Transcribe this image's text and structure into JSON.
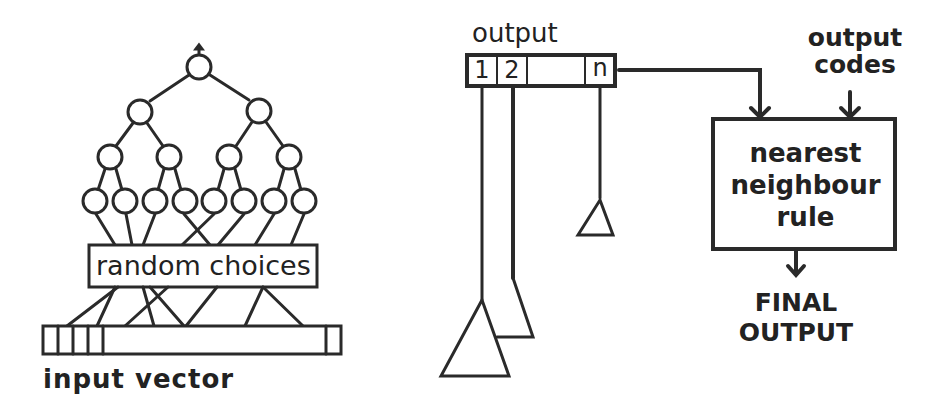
{
  "colors": {
    "ink": "#2a2a2a",
    "background": "#ffffff"
  },
  "left_panel": {
    "middle_box_label": "random choices",
    "bottom_label": "input vector"
  },
  "right_panel": {
    "output_label": "output",
    "output_cells": [
      "1",
      "2",
      "n"
    ],
    "codes_label_line1": "output",
    "codes_label_line2": "codes",
    "rule_box_line1": "nearest",
    "rule_box_line2": "neighbour",
    "rule_box_line3": "rule",
    "final_line1": "FINAL",
    "final_line2": "OUTPUT"
  }
}
